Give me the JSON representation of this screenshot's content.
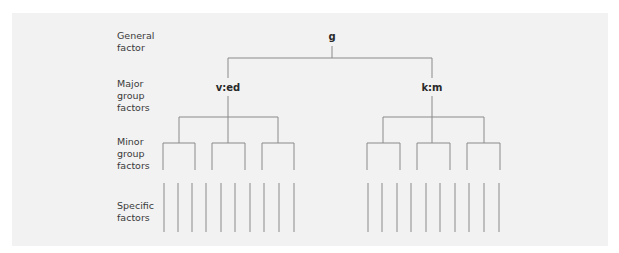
{
  "diagram": {
    "type": "hierarchical factor model tree",
    "row_labels": [
      {
        "id": "general",
        "text": "General\nfactor"
      },
      {
        "id": "major",
        "text": "Major\ngroup\nfactors"
      },
      {
        "id": "minor",
        "text": "Minor\ngroup\nfactors"
      },
      {
        "id": "specific",
        "text": "Specific\nfactors"
      }
    ],
    "nodes": {
      "general": "g",
      "major": [
        "v:ed",
        "k:m"
      ]
    },
    "structure": {
      "minor_groups_per_major": 3,
      "specific_factors_per_major": 10
    },
    "colors": {
      "panel": "#f2f2f2",
      "lines": "#8a8a8a",
      "text": "#3a3a3a"
    }
  }
}
